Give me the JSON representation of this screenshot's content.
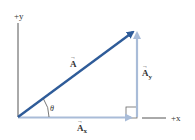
{
  "diagram": {
    "axes": {
      "y_label": "+y",
      "x_label": "+x"
    },
    "vectors": {
      "resultant": {
        "label": "A",
        "arrow_mark": "→"
      },
      "y_component": {
        "label": "A",
        "subscript": "y",
        "arrow_mark": "→"
      },
      "x_component": {
        "label": "A",
        "subscript": "x",
        "arrow_mark": "→"
      }
    },
    "angle_label": "θ",
    "colors": {
      "resultant": "#2f5c99",
      "components": "#a9bcd8",
      "axes": "#555555",
      "text": "#333333"
    }
  }
}
